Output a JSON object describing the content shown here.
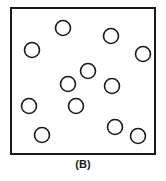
{
  "figure": {
    "caption": "(B)",
    "panel_label": "B",
    "colors": {
      "background": "#ffffff",
      "stroke": "#1a1a1a",
      "fill": "#ffffff",
      "caption": "#1a1a1a"
    },
    "frame": {
      "x": 10,
      "y": 7,
      "width": 146,
      "height": 148,
      "stroke_width": 2
    },
    "marker": {
      "shape": "circle",
      "radius": 7.5,
      "stroke_width": 1.6,
      "count": 12
    }
  },
  "chart_data": {
    "type": "scatter",
    "title": "(B)",
    "xlabel": "",
    "ylabel": "",
    "xlim": [
      10,
      156
    ],
    "ylim": [
      7,
      155
    ],
    "grid": false,
    "legend": null,
    "series": [
      {
        "name": "circles",
        "marker": "open-circle",
        "radius": 7.5,
        "points": [
          {
            "x": 63,
            "y": 28
          },
          {
            "x": 32,
            "y": 50
          },
          {
            "x": 111,
            "y": 36
          },
          {
            "x": 143,
            "y": 54
          },
          {
            "x": 88,
            "y": 71
          },
          {
            "x": 68,
            "y": 84
          },
          {
            "x": 112,
            "y": 86
          },
          {
            "x": 29,
            "y": 106
          },
          {
            "x": 76,
            "y": 106
          },
          {
            "x": 115,
            "y": 127
          },
          {
            "x": 42,
            "y": 135
          },
          {
            "x": 138,
            "y": 136
          }
        ]
      }
    ]
  }
}
